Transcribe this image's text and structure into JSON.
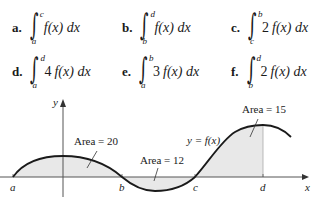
{
  "problems": [
    {
      "label": "a.",
      "lower": "a",
      "upper": "c",
      "coef": "",
      "integrand": "f(x) dx"
    },
    {
      "label": "b.",
      "lower": "b",
      "upper": "d",
      "coef": "",
      "integrand": "f(x) dx"
    },
    {
      "label": "c.",
      "lower": "c",
      "upper": "b",
      "coef": "2",
      "integrand": "f(x) dx"
    },
    {
      "label": "d.",
      "lower": "a",
      "upper": "d",
      "coef": "4",
      "integrand": "f(x) dx"
    },
    {
      "label": "e.",
      "lower": "a",
      "upper": "b",
      "coef": "3",
      "integrand": "f(x) dx"
    },
    {
      "label": "f.",
      "lower": "b",
      "upper": "d",
      "coef": "2",
      "integrand": "f(x) dx"
    }
  ],
  "graph": {
    "x_axis_label": "x",
    "y_axis_label": "y",
    "curve_label": "y = f(x)",
    "ticks": [
      "a",
      "b",
      "c",
      "d"
    ],
    "areas": [
      {
        "region": "a to b",
        "text": "Area = 20"
      },
      {
        "region": "b to c",
        "text": "Area = 12"
      },
      {
        "region": "c to d",
        "text": "Area = 15"
      }
    ],
    "colors": {
      "curve": "#1a1a1a",
      "shade": "#e8e8e8",
      "axis": "#555555"
    }
  }
}
